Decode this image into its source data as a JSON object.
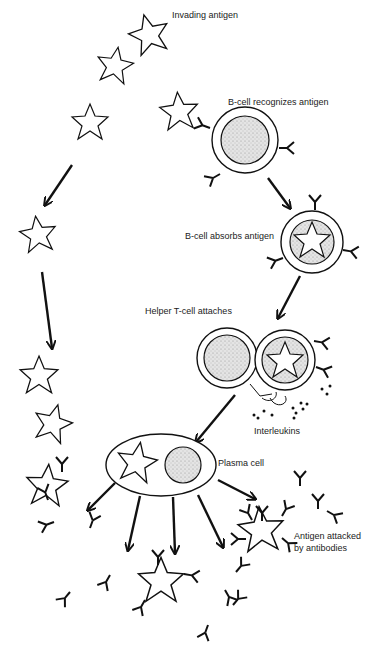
{
  "diagram": {
    "title": "",
    "type": "immune response cycle",
    "colors": {
      "ink": "#111111",
      "nucleus_fill": "#d8d8d8",
      "background": "#ffffff"
    },
    "labels": {
      "invading_antigen": "Invading antigen",
      "b_cell_recognizes": "B-cell recognizes antigen",
      "b_cell_absorbs": "B-cell absorbs antigen",
      "helper_t_cell": "Helper T-cell attaches",
      "interleukins": "Interleukins",
      "plasma_cell": "Plasma cell",
      "antigen_attacked_line1": "Antigen attacked",
      "antigen_attacked_line2": "by antibodies"
    },
    "stages": [
      "Invading antigen",
      "B-cell recognizes antigen",
      "B-cell absorbs antigen",
      "Helper T-cell attaches",
      "Interleukins",
      "Plasma cell",
      "Antigen attacked by antibodies"
    ]
  }
}
